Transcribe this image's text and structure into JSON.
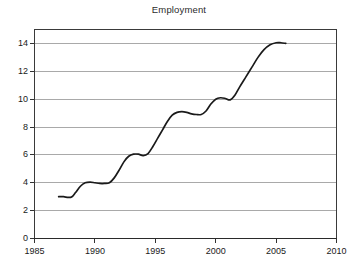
{
  "chart_data": {
    "type": "line",
    "title": "Employment",
    "xlabel": "",
    "ylabel": "",
    "xlim": [
      1985,
      2010
    ],
    "ylim": [
      0,
      15
    ],
    "xticks": [
      1985,
      1990,
      1995,
      2000,
      2005,
      2010
    ],
    "xtick_labels": [
      "1985",
      "1990",
      "1995",
      "2000",
      "2005",
      "2010"
    ],
    "yticks": [
      0,
      2,
      4,
      6,
      8,
      10,
      12,
      14
    ],
    "ytick_labels": [
      "0",
      "2",
      "4",
      "6",
      "8",
      "10",
      "12",
      "14"
    ],
    "grid": "horizontal",
    "legend": null,
    "series": [
      {
        "name": "Employment",
        "color": "#1a1a1a",
        "x": [
          1987.0,
          1987.4,
          1987.8,
          1988.1,
          1988.4,
          1988.8,
          1989.2,
          1989.6,
          1990.0,
          1990.4,
          1990.8,
          1991.2,
          1991.6,
          1992.0,
          1992.4,
          1992.8,
          1993.2,
          1993.6,
          1994.0,
          1994.4,
          1994.8,
          1995.2,
          1995.6,
          1996.0,
          1996.4,
          1996.8,
          1997.2,
          1997.6,
          1998.0,
          1998.4,
          1998.8,
          1999.2,
          1999.6,
          2000.0,
          2000.4,
          2000.8,
          2001.2,
          2001.6,
          2002.0,
          2002.5,
          2003.0,
          2003.5,
          2004.0,
          2004.5,
          2005.0,
          2005.4,
          2005.8
        ],
        "y": [
          3.0,
          3.0,
          2.95,
          3.0,
          3.3,
          3.75,
          4.0,
          4.05,
          4.0,
          3.95,
          3.95,
          4.0,
          4.35,
          4.9,
          5.5,
          5.9,
          6.05,
          6.05,
          5.95,
          6.1,
          6.6,
          7.2,
          7.8,
          8.4,
          8.85,
          9.05,
          9.1,
          9.05,
          8.95,
          8.9,
          8.9,
          9.15,
          9.65,
          10.0,
          10.1,
          10.05,
          9.95,
          10.3,
          10.9,
          11.6,
          12.3,
          13.0,
          13.55,
          13.9,
          14.05,
          14.05,
          14.0
        ]
      }
    ]
  },
  "axes": {
    "title": "Employment"
  }
}
